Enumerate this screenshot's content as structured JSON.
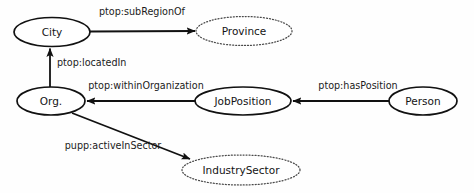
{
  "diagram": {
    "type": "directed-graph",
    "background_color": "#ffffff",
    "node_stroke_color": "#111111",
    "node_dotted_stroke_color": "#4a4a4a",
    "edge_color": "#111111",
    "text_color": "#141414",
    "nodes": [
      {
        "id": "city",
        "label": "City",
        "style": "solid",
        "cx": 52,
        "cy": 32,
        "rx": 38,
        "ry": 14.5
      },
      {
        "id": "province",
        "label": "Province",
        "style": "dotted",
        "cx": 244,
        "cy": 31,
        "rx": 48,
        "ry": 14.5
      },
      {
        "id": "org",
        "label": "Org.",
        "style": "solid",
        "cx": 51,
        "cy": 101,
        "rx": 34,
        "ry": 14
      },
      {
        "id": "jobposition",
        "label": "JobPosition",
        "style": "solid",
        "cx": 243,
        "cy": 101,
        "rx": 48,
        "ry": 14
      },
      {
        "id": "person",
        "label": "Person",
        "style": "solid",
        "cx": 423,
        "cy": 101,
        "rx": 34,
        "ry": 14
      },
      {
        "id": "industrysector",
        "label": "IndustrySector",
        "style": "dotted",
        "cx": 241,
        "cy": 170,
        "rx": 59,
        "ry": 15
      }
    ],
    "edges": [
      {
        "id": "city-subregionof-province",
        "label": "ptop:subRegionOf",
        "source": "city",
        "target": "province",
        "label_x": 142,
        "label_y": 12
      },
      {
        "id": "org-locatedin-city",
        "label": "ptop:locatedIn",
        "source": "org",
        "target": "city",
        "label_x": 95,
        "label_y": 63
      },
      {
        "id": "jobposition-withinorganization-org",
        "label": "ptop:withinOrganization",
        "source": "jobposition",
        "target": "org",
        "label_x": 146,
        "label_y": 86
      },
      {
        "id": "person-hasposition-jobposition",
        "label": "ptop:hasPosition",
        "source": "person",
        "target": "jobposition",
        "label_x": 358,
        "label_y": 86
      },
      {
        "id": "org-activeinsector-industrysector",
        "label": "pupp:activeInSector",
        "source": "org",
        "target": "industrysector",
        "label_x": 113,
        "label_y": 146
      }
    ]
  }
}
